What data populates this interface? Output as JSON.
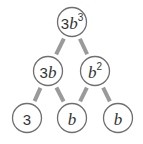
{
  "diagram": {
    "type": "factor-tree",
    "nodes": [
      {
        "id": "root",
        "parts": [
          {
            "t": "3",
            "style": "num"
          },
          {
            "t": "b",
            "style": "var"
          },
          {
            "t": "3",
            "style": "sup"
          }
        ]
      },
      {
        "id": "mid-left",
        "parts": [
          {
            "t": "3",
            "style": "num"
          },
          {
            "t": "b",
            "style": "var"
          }
        ]
      },
      {
        "id": "mid-right",
        "parts": [
          {
            "t": "b",
            "style": "var"
          },
          {
            "t": "2",
            "style": "sup"
          }
        ]
      },
      {
        "id": "leaf-left",
        "parts": [
          {
            "t": "3",
            "style": "num"
          }
        ]
      },
      {
        "id": "leaf-mid",
        "parts": [
          {
            "t": "b",
            "style": "var"
          }
        ]
      },
      {
        "id": "leaf-right",
        "parts": [
          {
            "t": "b",
            "style": "var"
          }
        ]
      }
    ],
    "edges": [
      {
        "from": "root",
        "to": "mid-left"
      },
      {
        "from": "root",
        "to": "mid-right"
      },
      {
        "from": "mid-left",
        "to": "leaf-left"
      },
      {
        "from": "mid-left",
        "to": "leaf-mid"
      },
      {
        "from": "mid-right",
        "to": "leaf-mid"
      },
      {
        "from": "mid-right",
        "to": "leaf-right"
      }
    ],
    "colors": {
      "edge": "#9a9a9a",
      "node_border": "#6f6f6f",
      "text": "#333333"
    }
  }
}
